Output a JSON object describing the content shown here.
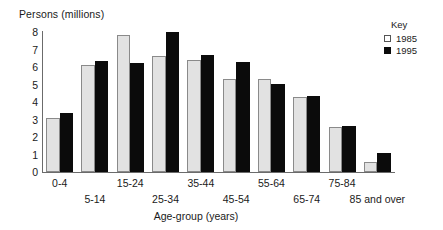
{
  "chart_data": {
    "type": "bar",
    "title": "",
    "xlabel": "Age-group (years)",
    "ylabel": "Persons (millions)",
    "ylim": [
      0,
      8
    ],
    "yticks": [
      8,
      7,
      6,
      5,
      4,
      3,
      2,
      1,
      0
    ],
    "grid": false,
    "legend_position": "top-right",
    "legend_title": "Key",
    "categories": [
      "0-4",
      "5-14",
      "15-24",
      "25-34",
      "35-44",
      "45-54",
      "55-64",
      "65-74",
      "75-84",
      "85 and over"
    ],
    "series": [
      {
        "name": "1985",
        "color": "#e2e2e2",
        "values": [
          3.1,
          6.1,
          7.85,
          6.65,
          6.4,
          5.3,
          5.3,
          4.3,
          2.6,
          0.55
        ]
      },
      {
        "name": "1995",
        "color": "#0b0b0b",
        "values": [
          3.35,
          6.35,
          6.25,
          8.0,
          6.7,
          6.3,
          5.05,
          4.35,
          2.65,
          1.1
        ]
      }
    ]
  }
}
